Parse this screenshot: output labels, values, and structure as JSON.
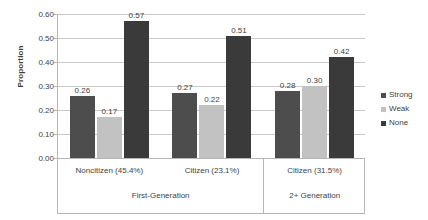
{
  "chart_data": {
    "type": "bar",
    "title": "",
    "xlabel": "",
    "ylabel": "Proportion",
    "ylim": [
      0.0,
      0.6
    ],
    "ytick_labels": [
      "0.00",
      "0.10",
      "0.20",
      "0.30",
      "0.40",
      "0.50",
      "0.60"
    ],
    "ytick_values": [
      0.0,
      0.1,
      0.2,
      0.3,
      0.4,
      0.5,
      0.6
    ],
    "grid": true,
    "legend_position": "right",
    "categories": [
      "Noncitizen (45.4%)",
      "Citizen (23.1%)",
      "Citizen (31.5%)"
    ],
    "supergroups": [
      {
        "label": "First-Generation",
        "categories": [
          "Noncitizen (45.4%)",
          "Citizen (23.1%)"
        ]
      },
      {
        "label": "2+ Generation",
        "categories": [
          "Citizen (31.5%)"
        ]
      }
    ],
    "series": [
      {
        "name": "Strong",
        "color": "#4d4d4d",
        "values": [
          0.26,
          0.27,
          0.28
        ],
        "labels": [
          "0.26",
          "0.27",
          "0.28"
        ]
      },
      {
        "name": "Weak",
        "color": "#c2c2c2",
        "values": [
          0.17,
          0.22,
          0.3
        ],
        "labels": [
          "0.17",
          "0.22",
          "0.30"
        ]
      },
      {
        "name": "None",
        "color": "#3a3a3a",
        "values": [
          0.57,
          0.51,
          0.42
        ],
        "labels": [
          "0.57",
          "0.51",
          "0.42"
        ]
      }
    ]
  },
  "legend": {
    "items": [
      {
        "label": "Strong",
        "color": "#4d4d4d"
      },
      {
        "label": "Weak",
        "color": "#c2c2c2"
      },
      {
        "label": "None",
        "color": "#3a3a3a"
      }
    ]
  }
}
